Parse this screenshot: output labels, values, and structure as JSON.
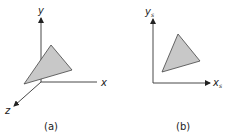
{
  "colors": {
    "axis": "#333333",
    "triangle_fill": "#c8c8c8",
    "triangle_stroke": "#444444",
    "background": "#ffffff"
  },
  "panels": [
    {
      "caption": "(a)",
      "axes": {
        "y_label": "y",
        "x_label": "x",
        "z_label": "z"
      }
    },
    {
      "caption": "(b)",
      "axes": {
        "y_label": "y",
        "y_sub": "s",
        "x_label": "x",
        "x_sub": "s"
      }
    }
  ]
}
